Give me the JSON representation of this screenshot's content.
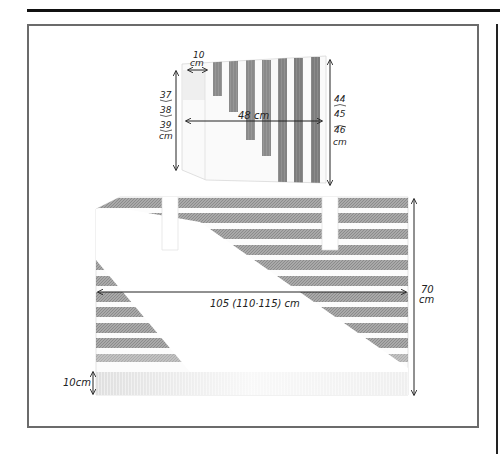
{
  "diagram": {
    "type": "knitting-schematic",
    "sleeve": {
      "cuff_width_label": {
        "value": "10",
        "unit": "cm"
      },
      "width_label": "48 cm",
      "left_height_labels": [
        "37",
        "38",
        "39",
        "cm"
      ],
      "right_height_labels": [
        "44",
        "45",
        "46",
        "cm"
      ],
      "stripe_count": 7,
      "stripe_orientation": "vertical"
    },
    "body": {
      "width_label": "105 (110·115) cm",
      "height_label": {
        "value": "70",
        "unit": "cm"
      },
      "rib_label": "10cm",
      "stripe_count": 10,
      "stripe_orientation": "horizontal",
      "neck_slots": 2
    },
    "colors": {
      "stripe": "#8a8a8a",
      "stripe_dark": "#6e6e6e",
      "ink": "#222222",
      "frame": "#6b6b6b"
    }
  }
}
